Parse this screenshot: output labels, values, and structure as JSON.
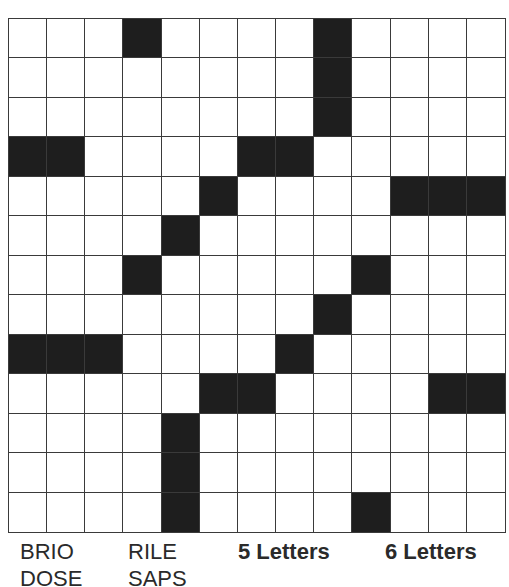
{
  "puzzle": {
    "rows": 13,
    "cols": 13,
    "black_cells": [
      [
        0,
        3
      ],
      [
        0,
        8
      ],
      [
        1,
        8
      ],
      [
        2,
        8
      ],
      [
        3,
        0
      ],
      [
        3,
        1
      ],
      [
        3,
        6
      ],
      [
        3,
        7
      ],
      [
        4,
        5
      ],
      [
        4,
        10
      ],
      [
        4,
        11
      ],
      [
        4,
        12
      ],
      [
        5,
        4
      ],
      [
        6,
        3
      ],
      [
        6,
        9
      ],
      [
        7,
        8
      ],
      [
        8,
        0
      ],
      [
        8,
        1
      ],
      [
        8,
        2
      ],
      [
        8,
        7
      ],
      [
        9,
        5
      ],
      [
        9,
        6
      ],
      [
        9,
        11
      ],
      [
        9,
        12
      ],
      [
        10,
        4
      ],
      [
        11,
        4
      ],
      [
        12,
        4
      ],
      [
        12,
        9
      ]
    ]
  },
  "word_list": {
    "col1": [
      "BRIO",
      "DOSE"
    ],
    "col2": [
      "RILE",
      "SAPS"
    ],
    "heading_5": "5 Letters",
    "heading_6": "6 Letters"
  },
  "colors": {
    "black_cell": "#1e1e1e",
    "grid_line": "#3a3a3a",
    "text": "#2a2a2a"
  }
}
